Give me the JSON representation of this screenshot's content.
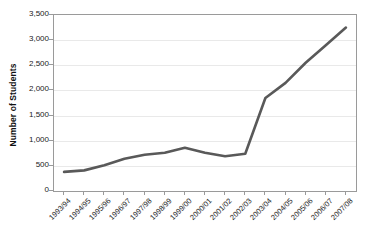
{
  "chart_data": {
    "type": "line",
    "title": "",
    "xlabel": "",
    "ylabel": "Number of Students",
    "categories": [
      "1993/94",
      "1994/95",
      "1995/96",
      "1996/97",
      "1997/98",
      "1998/99",
      "1999/00",
      "2000/01",
      "2001/02",
      "2002/03",
      "2003/04",
      "2004/05",
      "2005/06",
      "2006/07",
      "2007/08"
    ],
    "values": [
      380,
      410,
      510,
      640,
      720,
      760,
      860,
      760,
      690,
      740,
      1850,
      2150,
      2550,
      2900,
      3250
    ],
    "ylim": [
      0,
      3500
    ],
    "ytick_values": [
      0,
      500,
      1000,
      1500,
      2000,
      2500,
      3000,
      3500
    ],
    "ytick_labels": [
      "0",
      "500",
      "1,000",
      "1,500",
      "2,000",
      "2,500",
      "3,000",
      "3,500"
    ],
    "grid": true,
    "legend": "none",
    "series_color": "#595959",
    "gridline_color": "#e9e9e9",
    "axis_color": "#9a9a9a",
    "background_color": "#ffffff"
  }
}
